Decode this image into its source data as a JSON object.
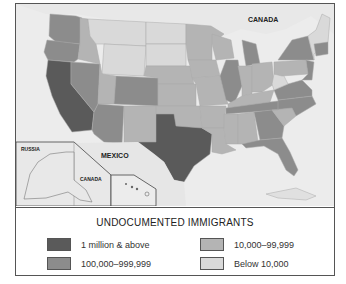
{
  "map": {
    "labels": {
      "canada_main": "CANADA",
      "russia": "RUSSIA",
      "mexico": "MEXICO",
      "canada_inset": "CANADA"
    },
    "colors": {
      "water": "#ececec",
      "foreign_land": "#e6e6e6",
      "tier1": "#5a5a5a",
      "tier2": "#8c8c8c",
      "tier3": "#b4b4b4",
      "tier4": "#d9d9d9"
    }
  },
  "legend": {
    "title": "UNDOCUMENTED IMMIGRANTS",
    "items": [
      {
        "label": "1 million & above",
        "color": "#5a5a5a"
      },
      {
        "label": "100,000–999,999",
        "color": "#8c8c8c"
      },
      {
        "label": "10,000–99,999",
        "color": "#b4b4b4"
      },
      {
        "label": "Below 10,000",
        "color": "#d9d9d9"
      }
    ]
  }
}
